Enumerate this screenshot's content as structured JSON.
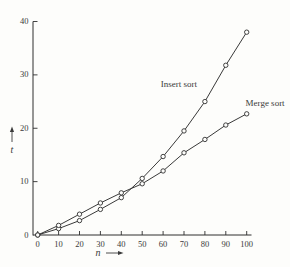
{
  "figure": {
    "background": "#fdfdfb",
    "line_color": "#2e2e2e",
    "text_color": "#3a3a3a"
  },
  "chart_data": {
    "type": "line",
    "title": "",
    "x": [
      0,
      10,
      20,
      30,
      40,
      50,
      60,
      70,
      80,
      90,
      100
    ],
    "series": [
      {
        "name": "Insert sort",
        "values": [
          0,
          1.2,
          2.7,
          4.8,
          7.0,
          10.6,
          14.7,
          19.5,
          25.0,
          31.8,
          38.0
        ],
        "label_pos": {
          "x": 67.5,
          "y": 27.8
        }
      },
      {
        "name": "Merge sort",
        "values": [
          0,
          1.8,
          3.9,
          6.0,
          7.9,
          9.6,
          12.0,
          15.4,
          17.9,
          20.6,
          22.7
        ],
        "label_pos": {
          "x": 108.8,
          "y": 24.2
        }
      }
    ],
    "xlabel": "n",
    "ylabel": "t",
    "xlim": [
      0,
      100
    ],
    "ylim": [
      0,
      40
    ],
    "x_ticks": [
      0,
      10,
      20,
      30,
      40,
      50,
      60,
      70,
      80,
      90,
      100
    ],
    "y_ticks": [
      0,
      10,
      20,
      30,
      40
    ],
    "grid": false,
    "legend_position": "inline-labels",
    "marker": "open-circle"
  }
}
